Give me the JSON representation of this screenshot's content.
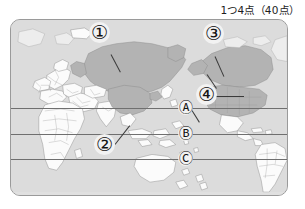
{
  "header": {
    "score_note": "1つ4点（40点）"
  },
  "map": {
    "title": "world-map",
    "ocean_color": "#dcdcdc",
    "land_plain_color": "#fbfbfb",
    "land_highlight_color": "#b4b4b4",
    "border_color": "#9a9a9a",
    "coast_color": "#7d7d7d",
    "lat_line_color": "#6f6f6f",
    "highlighted_regions": [
      "Russia",
      "China",
      "Canada",
      "United States"
    ],
    "number_markers": [
      {
        "id": "marker-1",
        "label": "①",
        "points_to": "Russia",
        "x": 89,
        "y": 22
      },
      {
        "id": "marker-2",
        "label": "②",
        "points_to": "China",
        "x": 94,
        "y": 134
      },
      {
        "id": "marker-3",
        "label": "③",
        "points_to": "Canada",
        "x": 203,
        "y": 23
      },
      {
        "id": "marker-4",
        "label": "④",
        "points_to": "United States",
        "x": 196,
        "y": 84
      }
    ],
    "letter_markers": [
      {
        "id": "marker-a",
        "label": "Ⓐ",
        "letter": "A",
        "x": 178,
        "y": 100
      },
      {
        "id": "marker-b",
        "label": "Ⓑ",
        "letter": "B",
        "x": 178,
        "y": 126
      },
      {
        "id": "marker-c",
        "label": "Ⓒ",
        "letter": "C",
        "x": 178,
        "y": 151
      }
    ],
    "latitude_lines": [
      {
        "id": "lat-line-a",
        "y": 107
      },
      {
        "id": "lat-line-b",
        "y": 133
      },
      {
        "id": "lat-line-c",
        "y": 158
      }
    ]
  }
}
